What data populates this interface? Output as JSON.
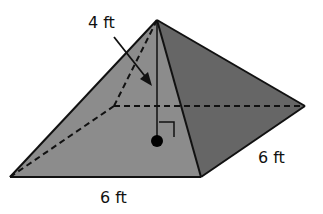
{
  "figure": {
    "type": "square pyramid",
    "labels": {
      "height": "4 ft",
      "base_front": "6 ft",
      "base_side": "6 ft"
    },
    "colors": {
      "background": "#ffffff",
      "front_face": "#8c8c8c",
      "right_face": "#666666",
      "edge": "#111111",
      "hidden_edge": "#111111"
    },
    "vertices": {
      "apex": [
        157,
        20
      ],
      "front_left": [
        10,
        177
      ],
      "front_right": [
        201,
        177
      ],
      "back_right": [
        305,
        106
      ],
      "back_left_hidden": [
        114,
        106
      ],
      "base_center": [
        157,
        141
      ]
    }
  }
}
